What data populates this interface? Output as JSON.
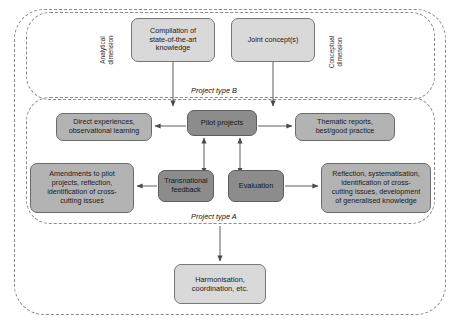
{
  "diagram": {
    "frames": [
      {
        "id": "type_b",
        "caption": "Project type B"
      },
      {
        "id": "type_a",
        "caption": "Project type A"
      }
    ],
    "dimension_labels": {
      "analytical": {
        "line1": "Analytical",
        "line2": "dimension"
      },
      "conceptual": {
        "line1": "Conceptual",
        "line2": "dimension"
      }
    },
    "nodes": {
      "compilation": {
        "line1": "Compilation of",
        "line2": "state-of-the-art",
        "line3": "knowledge",
        "fill": "#d9d9d9"
      },
      "joint_concepts": {
        "line1": "Joint concept(s)",
        "fill": "#d9d9d9"
      },
      "direct_experiences": {
        "line1": "Direct experiences,",
        "line2": "observational learning",
        "fill": "#b3b3b3"
      },
      "pilot_projects": {
        "line1": "Pilot projects",
        "fill": "#8c8c8c"
      },
      "thematic_reports": {
        "line1": "Thematic reports,",
        "line2": "best/good practice",
        "fill": "#b3b3b3"
      },
      "amendments": {
        "line1": "Amendments to pilot",
        "line2": "projects, reflection,",
        "line3": "identification of cross-",
        "line4": "cutting issues",
        "fill": "#b3b3b3"
      },
      "transnational_feedback": {
        "line1": "Transnational",
        "line2": "feedback",
        "fill": "#8c8c8c"
      },
      "evaluation": {
        "line1": "Evaluation",
        "fill": "#8c8c8c"
      },
      "reflection": {
        "line1": "Reflection, systematisation,",
        "line2": "identification of cross-",
        "line3": "cutting issues, development",
        "line4": "of generalised knowledge",
        "fill": "#b3b3b3"
      },
      "harmonisation": {
        "line1": "Harmonisation,",
        "line2": "coordination, etc.",
        "fill": "#d9d9d9"
      }
    },
    "colors": {
      "frame_border": "#8a8a8a",
      "node_border": "#6e6e6e",
      "fill_light": "#d9d9d9",
      "fill_mid": "#b3b3b3",
      "fill_dark": "#8c8c8c",
      "arrow": "#4a4a4a",
      "background": "#ffffff"
    }
  }
}
